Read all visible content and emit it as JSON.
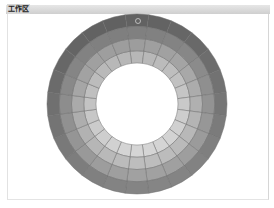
{
  "panel": {
    "title": "工作区"
  },
  "color_wheel": {
    "center": [
      137,
      104
    ],
    "outer_radius": 90,
    "inner_radius": 41,
    "rings": 4,
    "segments_per_ring": 24,
    "ring_base_colors": [
      "#dadada",
      "#c2c2c2",
      "#a6a6a6",
      "#8a8a8a"
    ],
    "shade_top_colors": [
      "#b2b2b2",
      "#989898",
      "#7a7a7a",
      "#5c5c5c"
    ],
    "segment_line_color": "#6e6e6e",
    "handle_icon": "selection-ring-icon",
    "handle_position": [
      138,
      21
    ]
  }
}
